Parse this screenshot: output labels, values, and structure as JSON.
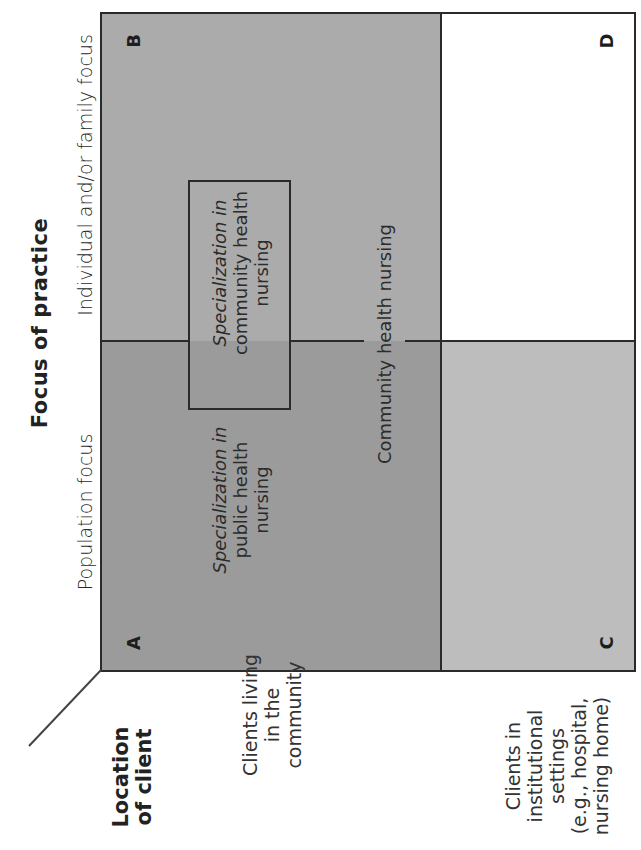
{
  "diagram": {
    "title": "Focus of practice",
    "columns": {
      "population": "Population focus",
      "individual": "Individual and/or family focus"
    },
    "row_axis_title_line1": "Location",
    "row_axis_title_line2": "of client",
    "rows": {
      "community": "Clients living\nin the\ncommunity",
      "institutional": "Clients in\ninstitutional\nsettings\n(e.g., hospital,\nnursing home)"
    },
    "quadrants": {
      "A": {
        "letter": "A",
        "fill": "#9b9b9b"
      },
      "B": {
        "letter": "B",
        "fill": "#ababab"
      },
      "C": {
        "letter": "C",
        "fill": "#bdbdbd"
      },
      "D": {
        "letter": "D",
        "fill": "#ffffff"
      }
    },
    "labels": {
      "public_health_specialization_italic": "Specialization in",
      "public_health_specialization_rest": "public health\nnursing",
      "community_health_specialization_italic": "Specialization in",
      "community_health_specialization_rest": "community health\nnursing",
      "community_health_nursing": "Community health nursing"
    }
  }
}
